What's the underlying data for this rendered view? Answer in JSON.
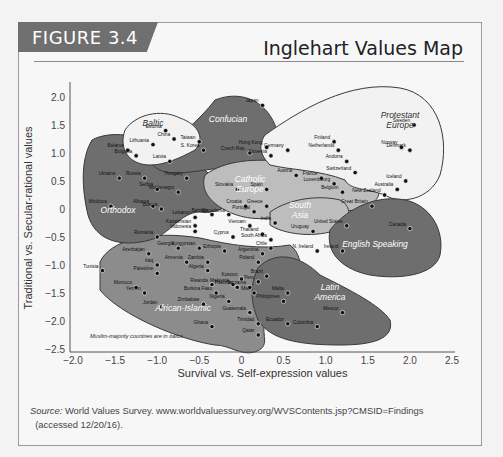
{
  "figure": {
    "label": "FIGURE 3.4",
    "title": "Inglehart Values Map"
  },
  "source": {
    "prefix": "Source:",
    "text": " World Values Survey. www.worldvaluessurvey.org/WVSContents.jsp?CMSID=Findings",
    "text2": "(accessed 12/20/16)."
  },
  "colors": {
    "background": "#f7f7f7",
    "dark_region": "#6e6e6e",
    "mid_region": "#8c8c8c",
    "light_region": "#bdbdbd",
    "white_region": "#f2f2f2",
    "label_box": "#6f6f6f"
  },
  "chart_data": {
    "type": "scatter",
    "title": "Inglehart Values Map",
    "xlabel": "Survival vs. Self-expression values",
    "ylabel": "Traditional vs. Secular-rational values",
    "xlim": [
      -2.0,
      2.5
    ],
    "ylim": [
      -2.5,
      2.0
    ],
    "xticks": [
      "−2.0",
      "−1.5",
      "−1.0",
      "−0.5",
      "0",
      "0.5",
      "1.0",
      "1.5",
      "2.0",
      "2.5"
    ],
    "xtick_values": [
      -2.0,
      -1.5,
      -1.0,
      -0.5,
      0,
      0.5,
      1.0,
      1.5,
      2.0,
      2.5
    ],
    "yticks": [
      "2.0",
      "1.5",
      "1.0",
      "0.5",
      "0",
      "−0.5",
      "−1.0",
      "−1.5",
      "−2.0",
      "−2.5"
    ],
    "ytick_values": [
      2.0,
      1.5,
      1.0,
      0.5,
      0,
      -0.5,
      -1.0,
      -1.5,
      -2.0,
      -2.5
    ],
    "grid": false,
    "note": "Muslim-majority countries are in italics",
    "regions": [
      {
        "name": "Confucian",
        "label": "Confucian",
        "shade": "dark"
      },
      {
        "name": "Baltic",
        "label": "Baltic",
        "shade": "white"
      },
      {
        "name": "Protestant Europe",
        "label": "Protestant Europe",
        "shade": "white"
      },
      {
        "name": "Catholic Europe",
        "label": "Catholic Europe",
        "shade": "light"
      },
      {
        "name": "Orthodox",
        "label": "Orthodox",
        "shade": "dark"
      },
      {
        "name": "South Asia",
        "label": "South Asia",
        "shade": "light"
      },
      {
        "name": "English Speaking",
        "label": "English Speaking",
        "shade": "dark"
      },
      {
        "name": "African-Islamic",
        "label": "African-Islamic",
        "shade": "mid"
      },
      {
        "name": "Latin America",
        "label": "Latin America",
        "shade": "dark"
      }
    ],
    "points": [
      {
        "name": "Japan",
        "x": 0.25,
        "y": 1.85
      },
      {
        "name": "Estonia",
        "x": -0.9,
        "y": 1.4
      },
      {
        "name": "Lithuania",
        "x": -1.05,
        "y": 1.15
      },
      {
        "name": "China",
        "x": -0.8,
        "y": 1.25
      },
      {
        "name": "Taiwan",
        "x": -0.5,
        "y": 1.2
      },
      {
        "name": "S. Korea",
        "x": -0.45,
        "y": 1.05
      },
      {
        "name": "Hong Kong",
        "x": 0.3,
        "y": 1.1
      },
      {
        "name": "Czech Rep.",
        "x": 0.1,
        "y": 1.0
      },
      {
        "name": "Slovenia",
        "x": 0.35,
        "y": 0.95
      },
      {
        "name": "Latvia",
        "x": -0.85,
        "y": 0.85
      },
      {
        "name": "Belarus",
        "x": -1.35,
        "y": 1.05
      },
      {
        "name": "Bulgaria",
        "x": -1.25,
        "y": 0.95
      },
      {
        "name": "Ukraine",
        "x": -1.45,
        "y": 0.55
      },
      {
        "name": "Russia",
        "x": -1.15,
        "y": 0.55
      },
      {
        "name": "Hungary",
        "x": -0.65,
        "y": 0.55
      },
      {
        "name": "Germany",
        "x": 0.55,
        "y": 1.05
      },
      {
        "name": "Finland",
        "x": 1.1,
        "y": 1.2
      },
      {
        "name": "Netherlands",
        "x": 1.15,
        "y": 1.05
      },
      {
        "name": "Sweden",
        "x": 2.05,
        "y": 1.5
      },
      {
        "name": "Norway",
        "x": 1.9,
        "y": 1.1
      },
      {
        "name": "Denmark",
        "x": 2.0,
        "y": 1.05
      },
      {
        "name": "Austria",
        "x": 0.65,
        "y": 0.6
      },
      {
        "name": "France",
        "x": 0.95,
        "y": 0.55
      },
      {
        "name": "Andorra",
        "x": 1.25,
        "y": 0.85
      },
      {
        "name": "Switzerland",
        "x": 1.35,
        "y": 0.65
      },
      {
        "name": "Iceland",
        "x": 1.95,
        "y": 0.5
      },
      {
        "name": "Luxembourg",
        "x": 1.1,
        "y": 0.45
      },
      {
        "name": "Belgium",
        "x": 1.2,
        "y": 0.3
      },
      {
        "name": "Spain",
        "x": 0.3,
        "y": 0.35
      },
      {
        "name": "Slovakia",
        "x": -0.05,
        "y": 0.35
      },
      {
        "name": "Serbia",
        "x": -1.0,
        "y": 0.35
      },
      {
        "name": "Montenegro",
        "x": -0.75,
        "y": 0.3
      },
      {
        "name": "Moldova",
        "x": -1.55,
        "y": 0.05
      },
      {
        "name": "Albania",
        "x": -1.05,
        "y": 0.05
      },
      {
        "name": "Bosnia",
        "x": -0.95,
        "y": 0.0
      },
      {
        "name": "Croatia",
        "x": 0.05,
        "y": 0.05
      },
      {
        "name": "Greece",
        "x": 0.3,
        "y": 0.05
      },
      {
        "name": "Portugal",
        "x": 0.15,
        "y": -0.05
      },
      {
        "name": "India",
        "x": 0.4,
        "y": -0.25
      },
      {
        "name": "Lebanon",
        "x": -0.55,
        "y": -0.15
      },
      {
        "name": "Bahrain",
        "x": -0.35,
        "y": -0.1
      },
      {
        "name": "Macedonia",
        "x": -0.15,
        "y": -0.1
      },
      {
        "name": "Kazakhstan",
        "x": -0.55,
        "y": -0.3
      },
      {
        "name": "Indonesia",
        "x": -0.55,
        "y": -0.4
      },
      {
        "name": "Vietnam",
        "x": 0.1,
        "y": -0.3
      },
      {
        "name": "Thailand",
        "x": 0.25,
        "y": -0.45
      },
      {
        "name": "Cyprus",
        "x": -0.1,
        "y": -0.5
      },
      {
        "name": "South Africa",
        "x": 0.35,
        "y": -0.55
      },
      {
        "name": "Uruguay",
        "x": 0.85,
        "y": -0.4
      },
      {
        "name": "Chile",
        "x": 0.35,
        "y": -0.7
      },
      {
        "name": "N. Ireland",
        "x": 0.9,
        "y": -0.75
      },
      {
        "name": "Argentina",
        "x": 0.25,
        "y": -0.8
      },
      {
        "name": "Poland",
        "x": 0.2,
        "y": -0.95
      },
      {
        "name": "Brazil",
        "x": 0.3,
        "y": -1.2
      },
      {
        "name": "Romania",
        "x": -1.0,
        "y": -0.5
      },
      {
        "name": "Georgia",
        "x": -0.75,
        "y": -0.7
      },
      {
        "name": "Armenia",
        "x": -0.65,
        "y": -0.95
      },
      {
        "name": "Azerbaijan",
        "x": -1.1,
        "y": -0.8
      },
      {
        "name": "Kyrgyzstan",
        "x": -0.5,
        "y": -0.7
      },
      {
        "name": "Ethiopia",
        "x": -0.2,
        "y": -0.75
      },
      {
        "name": "Zambia",
        "x": -0.4,
        "y": -0.95
      },
      {
        "name": "Algeria",
        "x": -0.4,
        "y": -1.1
      },
      {
        "name": "Tunisia",
        "x": -1.65,
        "y": -1.1
      },
      {
        "name": "Iraq",
        "x": -1.0,
        "y": -1.0
      },
      {
        "name": "Palestine",
        "x": -1.0,
        "y": -1.15
      },
      {
        "name": "Morocco",
        "x": -1.25,
        "y": -1.4
      },
      {
        "name": "Yemen",
        "x": -1.15,
        "y": -1.5
      },
      {
        "name": "Jordan",
        "x": -0.95,
        "y": -1.75
      },
      {
        "name": "Rwanda",
        "x": -0.35,
        "y": -1.35
      },
      {
        "name": "Burkina Faso",
        "x": -0.3,
        "y": -1.5
      },
      {
        "name": "Malaysia",
        "x": -0.1,
        "y": -1.35
      },
      {
        "name": "Kosovo",
        "x": 0.0,
        "y": -1.25
      },
      {
        "name": "Pakistan",
        "x": -0.05,
        "y": -1.4
      },
      {
        "name": "Tanzania",
        "x": 0.1,
        "y": -1.4
      },
      {
        "name": "Mali",
        "x": 0.15,
        "y": -1.5
      },
      {
        "name": "Peru",
        "x": 0.2,
        "y": -1.3
      },
      {
        "name": "Zimbabwe",
        "x": -0.45,
        "y": -1.7
      },
      {
        "name": "Nigeria",
        "x": -0.15,
        "y": -1.65
      },
      {
        "name": "Ghana",
        "x": -0.35,
        "y": -2.1
      },
      {
        "name": "Qatar",
        "x": 0.2,
        "y": -2.25
      },
      {
        "name": "Malta",
        "x": 0.55,
        "y": -1.5
      },
      {
        "name": "Philippines",
        "x": 0.5,
        "y": -1.65
      },
      {
        "name": "Guatemala",
        "x": 0.1,
        "y": -1.85
      },
      {
        "name": "Trinidad",
        "x": 0.2,
        "y": -2.05
      },
      {
        "name": "Ecuador",
        "x": 0.55,
        "y": -2.05
      },
      {
        "name": "Colombia",
        "x": 0.9,
        "y": -2.1
      },
      {
        "name": "Mexico",
        "x": 1.2,
        "y": -1.85
      },
      {
        "name": "Australia",
        "x": 1.85,
        "y": 0.35
      },
      {
        "name": "New Zealand",
        "x": 1.7,
        "y": 0.25
      },
      {
        "name": "Great Britain",
        "x": 1.55,
        "y": 0.05
      },
      {
        "name": "United States",
        "x": 1.25,
        "y": -0.3
      },
      {
        "name": "Ireland",
        "x": 1.2,
        "y": -0.75
      },
      {
        "name": "Canada",
        "x": 2.0,
        "y": -0.35
      }
    ]
  }
}
